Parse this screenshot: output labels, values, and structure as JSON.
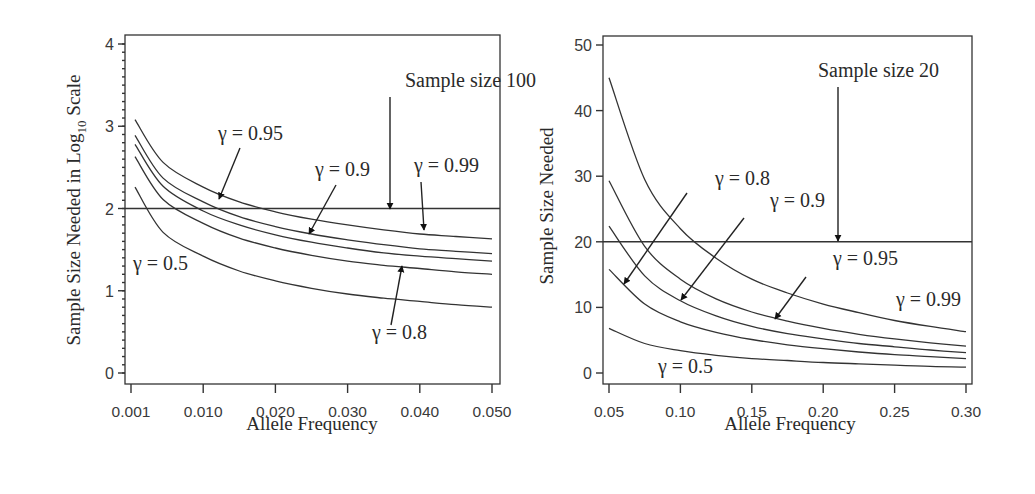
{
  "chart_data": [
    {
      "type": "line",
      "panel": "left",
      "title": "",
      "xlabel": "Allele Frequency",
      "ylabel": "Sample Size Needed in Log10 Scale",
      "ylabel_parts": {
        "pre": "Sample Size Needed in Log",
        "sub": "10",
        "post": " Scale"
      },
      "x_tick_labels": [
        "0.001",
        "0.010",
        "0.020",
        "0.030",
        "0.040",
        "0.050"
      ],
      "x_tick_values": [
        0.001,
        0.01,
        0.02,
        0.03,
        0.04,
        0.05
      ],
      "y_tick_labels": [
        "0",
        "1",
        "2",
        "3",
        "4"
      ],
      "y_tick_values": [
        0,
        1,
        2,
        3,
        4
      ],
      "y_minor_step": 0.1,
      "xlim": [
        0.001,
        0.05
      ],
      "ylim": [
        -0.1,
        4.1
      ],
      "grid": false,
      "legend": "none (inline arrow annotations)",
      "x": [
        0.0015,
        0.005,
        0.01,
        0.015,
        0.02,
        0.025,
        0.03,
        0.035,
        0.04,
        0.045,
        0.05
      ],
      "series": [
        {
          "name": "γ = 0.99",
          "values": [
            3.08,
            2.56,
            2.26,
            2.08,
            1.96,
            1.87,
            1.8,
            1.74,
            1.69,
            1.66,
            1.63
          ]
        },
        {
          "name": "γ = 0.95",
          "values": [
            2.89,
            2.37,
            2.08,
            1.9,
            1.78,
            1.69,
            1.62,
            1.56,
            1.51,
            1.48,
            1.45
          ]
        },
        {
          "name": "γ = 0.9",
          "values": [
            2.78,
            2.27,
            1.97,
            1.8,
            1.68,
            1.59,
            1.52,
            1.46,
            1.42,
            1.39,
            1.36
          ]
        },
        {
          "name": "γ = 0.8",
          "values": [
            2.63,
            2.11,
            1.82,
            1.64,
            1.52,
            1.43,
            1.36,
            1.31,
            1.27,
            1.23,
            1.2
          ]
        },
        {
          "name": "γ = 0.5",
          "values": [
            2.26,
            1.71,
            1.42,
            1.24,
            1.12,
            1.03,
            0.96,
            0.91,
            0.87,
            0.83,
            0.8
          ]
        }
      ],
      "reference_line": {
        "y": 2,
        "label": "Sample size 100"
      },
      "annotations": [
        {
          "text": "Sample size 100",
          "tx": 405,
          "ty": 87,
          "x1": 390,
          "y1": 97,
          "x2": 390,
          "y2": 209
        },
        {
          "text": "γ = 0.95",
          "tx": 218,
          "ty": 140,
          "x1": 240,
          "y1": 148,
          "x2": 219,
          "y2": 199
        },
        {
          "text": "γ = 0.9",
          "tx": 315,
          "ty": 176,
          "x1": 336,
          "y1": 185,
          "x2": 309,
          "y2": 234
        },
        {
          "text": "γ = 0.99",
          "tx": 414,
          "ty": 172,
          "x1": 421,
          "y1": 182,
          "x2": 424,
          "y2": 230
        },
        {
          "text": "γ = 0.8",
          "tx": 372,
          "ty": 339,
          "x1": 391,
          "y1": 325,
          "x2": 402,
          "y2": 266
        },
        {
          "text": "γ = 0.5",
          "tx": 133,
          "ty": 270,
          "x1": null,
          "y1": null,
          "x2": null,
          "y2": null
        }
      ]
    },
    {
      "type": "line",
      "panel": "right",
      "title": "",
      "xlabel": "Allele Frequency",
      "ylabel": "Sample Size Needed",
      "x_tick_labels": [
        "0.05",
        "0.10",
        "0.15",
        "0.20",
        "0.25",
        "0.30"
      ],
      "x_tick_values": [
        0.05,
        0.1,
        0.15,
        0.2,
        0.25,
        0.3
      ],
      "y_tick_labels": [
        "0",
        "10",
        "20",
        "30",
        "40",
        "50"
      ],
      "y_tick_values": [
        0,
        10,
        20,
        30,
        40,
        50
      ],
      "xlim": [
        0.05,
        0.3
      ],
      "ylim": [
        -1.5,
        51.5
      ],
      "grid": false,
      "legend": "none (inline arrow annotations)",
      "x": [
        0.05,
        0.075,
        0.1,
        0.125,
        0.15,
        0.175,
        0.2,
        0.225,
        0.25,
        0.275,
        0.3
      ],
      "series": [
        {
          "name": "γ = 0.99",
          "values": [
            45.0,
            29.5,
            22.0,
            17.5,
            14.3,
            12.2,
            10.5,
            9.2,
            8.0,
            7.1,
            6.3
          ]
        },
        {
          "name": "γ = 0.95",
          "values": [
            29.3,
            19.3,
            14.3,
            11.3,
            9.3,
            7.9,
            6.8,
            5.9,
            5.2,
            4.6,
            4.1
          ]
        },
        {
          "name": "γ = 0.9",
          "values": [
            22.4,
            14.8,
            11.0,
            8.7,
            7.1,
            6.0,
            5.2,
            4.5,
            4.0,
            3.5,
            3.1
          ]
        },
        {
          "name": "γ = 0.8",
          "values": [
            15.8,
            10.5,
            7.8,
            6.2,
            5.1,
            4.3,
            3.7,
            3.2,
            2.8,
            2.5,
            2.2
          ]
        },
        {
          "name": "γ = 0.5",
          "values": [
            6.8,
            4.5,
            3.4,
            2.7,
            2.2,
            1.9,
            1.6,
            1.4,
            1.2,
            1.0,
            0.9
          ]
        }
      ],
      "reference_line": {
        "y": 20,
        "label": "Sample size 20"
      },
      "annotations": [
        {
          "text": "Sample size 20",
          "tx": 818,
          "ty": 77,
          "x1": 838,
          "y1": 87,
          "x2": 838,
          "y2": 241
        },
        {
          "text": "γ = 0.8",
          "tx": 715,
          "ty": 185,
          "x1": 687,
          "y1": 193,
          "x2": 624,
          "y2": 284
        },
        {
          "text": "γ = 0.9",
          "tx": 770,
          "ty": 207,
          "x1": 744,
          "y1": 218,
          "x2": 681,
          "y2": 300
        },
        {
          "text": "γ = 0.95",
          "tx": 833,
          "ty": 265,
          "x1": 806,
          "y1": 277,
          "x2": 775,
          "y2": 319
        },
        {
          "text": "γ = 0.99",
          "tx": 896,
          "ty": 306,
          "x1": null,
          "y1": null,
          "x2": null,
          "y2": null
        },
        {
          "text": "γ = 0.5",
          "tx": 658,
          "ty": 373,
          "x1": null,
          "y1": null,
          "x2": null,
          "y2": null
        }
      ]
    }
  ],
  "layout": {
    "panels": [
      {
        "frame": {
          "left": 125,
          "top": 35,
          "right": 500,
          "bottom": 384
        },
        "plot": {
          "x0": 131,
          "x1": 492,
          "y0": 373,
          "y1": 44
        },
        "xlog_like": true
      },
      {
        "frame": {
          "left": 603,
          "top": 36,
          "right": 972,
          "bottom": 384
        },
        "plot": {
          "x0": 609,
          "x1": 966,
          "y0": 373,
          "y1": 45
        },
        "xlog_like": false
      }
    ]
  }
}
